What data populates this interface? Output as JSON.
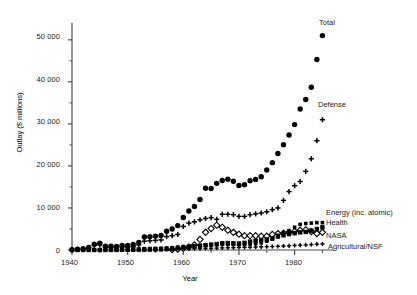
{
  "figure": {
    "axis_titles": {
      "x": "Year",
      "y": "Outlay ($ millions)"
    },
    "x_ticks": [
      "1940",
      "1950",
      "1960",
      "1970",
      "1980"
    ],
    "y_ticks": [
      "0",
      "10 000",
      "20 000",
      "30 000",
      "40 000",
      "50 000"
    ],
    "annotations": {
      "total": "Total",
      "defense": "Defense",
      "energy": "Energy (inc. atomic)",
      "health": "Health",
      "nasa": "NASA",
      "agri": "Agricultural/NSF"
    },
    "colors": {
      "ink": "#000000",
      "axis": "#4d4d4d",
      "background": "#ffffff"
    }
  },
  "chart_data": {
    "type": "scatter",
    "title": "",
    "xlabel": "Year",
    "ylabel": "Outlay ($ millions)",
    "xlim": [
      1940,
      1986
    ],
    "ylim": [
      0,
      54000
    ],
    "xticks": [
      1940,
      1950,
      1960,
      1970,
      1980
    ],
    "yticks": [
      0,
      10000,
      20000,
      30000,
      40000,
      50000
    ],
    "minor_ticks": true,
    "grid": false,
    "legend": "inline-annotations",
    "x": [
      1940,
      1941,
      1942,
      1943,
      1944,
      1945,
      1946,
      1947,
      1948,
      1949,
      1950,
      1951,
      1952,
      1953,
      1954,
      1955,
      1956,
      1957,
      1958,
      1959,
      1960,
      1961,
      1962,
      1963,
      1964,
      1965,
      1966,
      1967,
      1968,
      1969,
      1970,
      1971,
      1972,
      1973,
      1974,
      1975,
      1976,
      1977,
      1978,
      1979,
      1980,
      1981,
      1982,
      1983,
      1984,
      1985
    ],
    "series": [
      {
        "name": "Total",
        "marker": "filled-circle",
        "values": [
          74,
          198,
          280,
          602,
          1377,
          1591,
          918,
          900,
          855,
          1082,
          1083,
          1301,
          1816,
          3101,
          3148,
          3308,
          3446,
          4462,
          4991,
          5803,
          7738,
          9278,
          10373,
          12012,
          14707,
          14614,
          15853,
          16529,
          16859,
          16348,
          15340,
          15543,
          16495,
          16800,
          17410,
          19039,
          20780,
          22940,
          25020,
          27340,
          29830,
          33530,
          35800,
          38700,
          45300,
          51000
        ],
        "label_text": "Total"
      },
      {
        "name": "Defense",
        "marker": "plus",
        "values": [
          26,
          130,
          220,
          500,
          1100,
          1200,
          700,
          600,
          550,
          700,
          650,
          750,
          1200,
          2100,
          2200,
          2300,
          2400,
          3200,
          3400,
          3700,
          5600,
          6400,
          6700,
          7200,
          7500,
          7700,
          7300,
          8500,
          8500,
          8400,
          8000,
          8000,
          8400,
          8600,
          8800,
          9100,
          9600,
          10000,
          11800,
          13900,
          15300,
          16300,
          18700,
          21700,
          26000,
          31000
        ],
        "label_text": "Defense"
      },
      {
        "name": "Energy (inc. atomic)",
        "marker": "small-filled-square",
        "values": [
          0,
          0,
          0,
          0,
          0,
          0,
          0,
          0,
          30,
          60,
          70,
          110,
          200,
          300,
          350,
          380,
          420,
          480,
          550,
          700,
          800,
          900,
          1000,
          1100,
          1200,
          1250,
          1300,
          1350,
          1350,
          1350,
          1300,
          1300,
          1400,
          1500,
          1700,
          2100,
          2600,
          3500,
          4100,
          4600,
          5400,
          6100,
          6300,
          6400,
          6500,
          6500
        ],
        "label_text": "Energy (inc. atomic)"
      },
      {
        "name": "Health",
        "marker": "filled-square",
        "values": [
          3,
          3,
          4,
          5,
          6,
          7,
          8,
          12,
          20,
          40,
          60,
          70,
          80,
          90,
          110,
          140,
          180,
          230,
          300,
          420,
          560,
          700,
          870,
          1000,
          1150,
          1280,
          1400,
          1600,
          1650,
          1600,
          1550,
          1700,
          2000,
          2200,
          2300,
          2500,
          2800,
          3200,
          3500,
          3800,
          4000,
          4200,
          4300,
          4600,
          5000,
          5400
        ],
        "label_text": "Health"
      },
      {
        "name": "NASA",
        "marker": "open-diamond",
        "values": [
          0,
          0,
          0,
          0,
          0,
          0,
          0,
          0,
          0,
          0,
          0,
          0,
          0,
          0,
          0,
          0,
          0,
          0,
          100,
          200,
          400,
          700,
          1200,
          2500,
          4200,
          5100,
          5900,
          5400,
          4700,
          4200,
          3750,
          3400,
          3400,
          3400,
          3300,
          3300,
          3700,
          3900,
          4000,
          4200,
          4400,
          4700,
          4800,
          4400,
          3900,
          4200
        ],
        "label_text": "NASA"
      },
      {
        "name": "Agricultural/NSF",
        "marker": "small-plus",
        "values": [
          29,
          30,
          32,
          35,
          38,
          40,
          45,
          50,
          55,
          60,
          65,
          70,
          80,
          90,
          100,
          110,
          125,
          140,
          160,
          185,
          220,
          260,
          300,
          340,
          380,
          420,
          460,
          500,
          530,
          560,
          590,
          620,
          660,
          700,
          740,
          780,
          830,
          880,
          940,
          1000,
          1080,
          1150,
          1220,
          1300,
          1380,
          1450
        ],
        "label_text": "Agricultural/NSF"
      }
    ]
  }
}
